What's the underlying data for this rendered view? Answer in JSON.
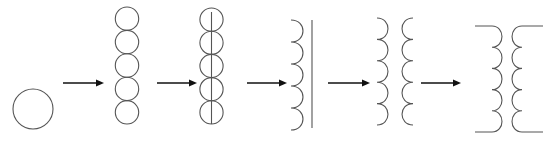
{
  "diagram": {
    "title": "",
    "colors": {
      "line": "#555555",
      "arrow": "#111111",
      "background": "#ffffff"
    },
    "stages": [
      {
        "id": "single-circle",
        "type": "circle",
        "cx": 33,
        "cy": 109,
        "r": 20
      },
      {
        "id": "stacked-circles",
        "type": "circle-stack",
        "cx": 127,
        "top": 7,
        "count": 5,
        "r": 11.7
      },
      {
        "id": "stacked-circles-bisected",
        "type": "circle-stack-line",
        "cx": 211.5,
        "top": 8,
        "count": 5,
        "r": 11.6
      },
      {
        "id": "half-coil-with-core",
        "type": "coil-core",
        "x": 291,
        "top": 20,
        "count": 5,
        "arcH": 22,
        "bulge": 12,
        "dir": 1,
        "coreX": 312
      },
      {
        "id": "two-half-coils",
        "type": "coil-pair",
        "left": {
          "x": 377,
          "top": 18,
          "count": 5,
          "arcH": 21.4,
          "bulge": 11,
          "dir": 1
        },
        "right": {
          "x": 413,
          "top": 18,
          "count": 5,
          "arcH": 21.4,
          "bulge": 11,
          "dir": -1
        }
      },
      {
        "id": "transformer-symbol",
        "type": "transformer",
        "left": {
          "x": 492,
          "top": 26,
          "count": 5,
          "arcH": 21.2,
          "bulge": 10,
          "dir": 1,
          "leadTo": 475
        },
        "right": {
          "x": 522,
          "top": 26,
          "count": 5,
          "arcH": 21.2,
          "bulge": 10,
          "dir": -1,
          "leadTo": 543
        }
      }
    ],
    "arrows": [
      {
        "x1": 63,
        "x2": 104,
        "y": 83
      },
      {
        "x1": 157,
        "x2": 197,
        "y": 83
      },
      {
        "x1": 247,
        "x2": 287,
        "y": 83
      },
      {
        "x1": 328,
        "x2": 370,
        "y": 83
      },
      {
        "x1": 421,
        "x2": 461,
        "y": 83
      }
    ]
  }
}
